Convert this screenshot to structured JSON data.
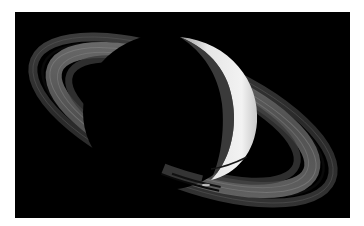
{
  "image": {
    "subject": "Saturn crescent with rings",
    "alt": "Crescent Saturn with its ring system against black space",
    "colors": {
      "page_background": "#ffffff",
      "space": "#000000",
      "planet_lit": "#e8e8e8",
      "planet_limb": "#bdbdbd",
      "ring_outer": "#3a3a3a",
      "ring_inner": "#6a6a6a",
      "ring_highlight": "#8a8a8a"
    }
  }
}
